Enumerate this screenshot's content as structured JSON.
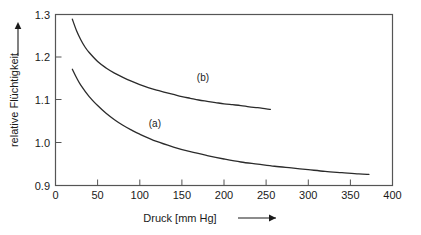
{
  "chart_data": {
    "type": "line",
    "title": "",
    "xlabel": "Druck [mm Hg]",
    "ylabel": "relative Flüchtigkeit",
    "xlim": [
      0,
      400
    ],
    "ylim": [
      0.9,
      1.3
    ],
    "xticks": [
      0,
      50,
      100,
      150,
      200,
      250,
      300,
      350,
      400
    ],
    "xtick_labels": [
      "0",
      "50",
      "100",
      "150",
      "200",
      "250",
      "300",
      "350",
      "400"
    ],
    "yticks": [
      0.9,
      1.0,
      1.1,
      1.2,
      1.3
    ],
    "ytick_labels": [
      "0.9",
      "1.0",
      "1.1",
      "1.2",
      "1.3"
    ],
    "grid": false,
    "legend": "inline-curve-labels",
    "series": [
      {
        "name": "(b)",
        "label": "(b)",
        "label_x": 175,
        "label_y": 1.145,
        "color": "#2b2b2b",
        "x": [
          20,
          25,
          30,
          35,
          40,
          50,
          60,
          70,
          80,
          90,
          100,
          110,
          120,
          130,
          140,
          150,
          160,
          170,
          180,
          190,
          200,
          210,
          220,
          230,
          240,
          250,
          255
        ],
        "y": [
          1.289,
          1.262,
          1.241,
          1.224,
          1.211,
          1.19,
          1.175,
          1.163,
          1.153,
          1.144,
          1.136,
          1.129,
          1.123,
          1.118,
          1.113,
          1.108,
          1.104,
          1.1,
          1.097,
          1.094,
          1.091,
          1.089,
          1.087,
          1.084,
          1.082,
          1.079,
          1.078
        ]
      },
      {
        "name": "(a)",
        "label": "(a)",
        "label_x": 118,
        "label_y": 1.038,
        "color": "#2b2b2b",
        "x": [
          20,
          25,
          30,
          40,
          50,
          60,
          70,
          80,
          90,
          100,
          120,
          140,
          160,
          180,
          200,
          220,
          240,
          260,
          280,
          300,
          320,
          340,
          360,
          372
        ],
        "y": [
          1.172,
          1.152,
          1.135,
          1.108,
          1.087,
          1.069,
          1.054,
          1.041,
          1.03,
          1.02,
          1.003,
          0.99,
          0.979,
          0.97,
          0.962,
          0.955,
          0.95,
          0.945,
          0.941,
          0.937,
          0.933,
          0.93,
          0.927,
          0.926
        ]
      }
    ]
  },
  "axes": {
    "x_arrow": "arrow-right",
    "y_arrow": "arrow-up"
  }
}
